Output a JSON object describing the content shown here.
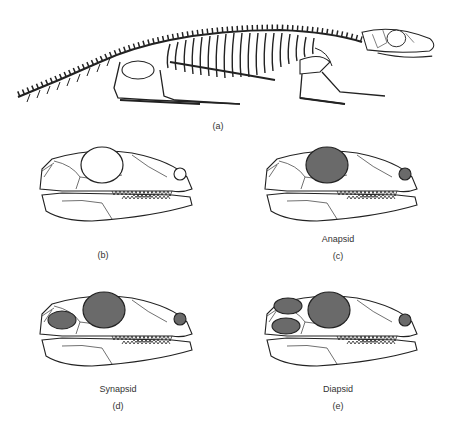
{
  "figure": {
    "panels": [
      {
        "id": "a",
        "label": "(a)",
        "caption": "",
        "subject": "skeleton"
      },
      {
        "id": "b",
        "label": "(b)",
        "caption": "",
        "subject": "skull",
        "temporal_openings": 0
      },
      {
        "id": "c",
        "label": "(c)",
        "caption": "Anapsid",
        "subject": "skull",
        "temporal_openings": 0
      },
      {
        "id": "d",
        "label": "(d)",
        "caption": "Synapsid",
        "subject": "skull",
        "temporal_openings": 1
      },
      {
        "id": "e",
        "label": "(e)",
        "caption": "Diapsid",
        "subject": "skull",
        "temporal_openings": 2
      }
    ],
    "colors": {
      "line": "#222222",
      "fill_dark": "#6a6a6a",
      "background": "#ffffff"
    }
  }
}
